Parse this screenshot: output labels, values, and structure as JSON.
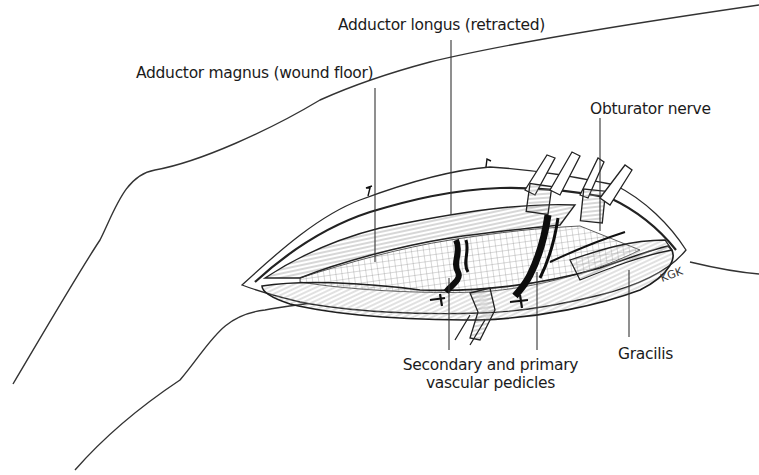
{
  "figure": {
    "artist_signature": "KGK"
  },
  "labels": {
    "adductor_longus": "Adductor longus (retracted)",
    "adductor_magnus": "Adductor magnus (wound floor)",
    "obturator_nerve": "Obturator nerve",
    "vascular_pedicles_line1": "Secondary and primary",
    "vascular_pedicles_line2": "vascular pedicles",
    "gracilis": "Gracilis"
  },
  "colors": {
    "line": "#2a2a2a",
    "shading": "#8a8a8a",
    "dark_vessel": "#111111",
    "background": "#ffffff"
  }
}
